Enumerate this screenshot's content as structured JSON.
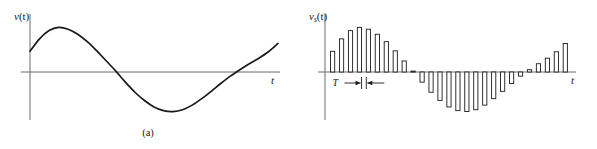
{
  "figure": {
    "width": 597,
    "height": 149,
    "background": "#ffffff",
    "stroke_color": "#1a1a1a",
    "axis_color": "#6b6b6b"
  },
  "panels": [
    {
      "id": "a",
      "caption": "(a)",
      "ylabel": "v(t)",
      "ylabel_base": "v",
      "ylabel_sub": "",
      "ylabel_arg": "(t)",
      "xlabel": "t",
      "kind": "continuous-waveform"
    },
    {
      "id": "b",
      "caption": "(b)",
      "ylabel": "vs(t)",
      "ylabel_base": "v",
      "ylabel_sub": "s",
      "ylabel_arg": "(t)",
      "xlabel": "t",
      "kind": "sampled-pulse-train",
      "period_label": "T"
    }
  ],
  "chart_data": [
    {
      "type": "line",
      "title": "",
      "panel": "a",
      "xlabel": "t",
      "ylabel": "v(t)",
      "grid": false,
      "legend": null,
      "xlim": [
        0,
        26
      ],
      "ylim": [
        -1.15,
        1.15
      ],
      "axis_origin_y": 0,
      "note": "Smooth continuous analog signal: rises from a positive start, peaks early, falls through zero to a deep negative trough, then rises back through zero and climbs at the right edge.",
      "x": [
        0,
        1,
        2,
        3,
        4,
        5,
        6,
        7,
        8,
        9,
        10,
        11,
        12,
        13,
        14,
        15,
        16,
        17,
        18,
        19,
        20,
        21,
        22,
        23,
        24,
        25,
        26
      ],
      "y": [
        0.45,
        0.72,
        0.9,
        0.97,
        0.93,
        0.82,
        0.66,
        0.46,
        0.24,
        0.02,
        -0.22,
        -0.44,
        -0.62,
        -0.76,
        -0.84,
        -0.86,
        -0.82,
        -0.72,
        -0.58,
        -0.42,
        -0.25,
        -0.09,
        0.05,
        0.18,
        0.3,
        0.44,
        0.62
      ]
    },
    {
      "type": "bar",
      "title": "",
      "panel": "b",
      "xlabel": "t",
      "ylabel": "vs(t)",
      "grid": false,
      "legend": null,
      "xlim": [
        0,
        26
      ],
      "ylim": [
        -1.15,
        1.15
      ],
      "axis_origin_y": 0,
      "sampling_period_label": "T",
      "note": "Sampled (pulse-amplitude-modulated) version of v(t): narrow rectangular pulses at uniform interval T whose heights follow the continuous waveform.",
      "categories": [
        "0",
        "1",
        "2",
        "3",
        "4",
        "5",
        "6",
        "7",
        "8",
        "9",
        "10",
        "11",
        "12",
        "13",
        "14",
        "15",
        "16",
        "17",
        "18",
        "19",
        "20",
        "21",
        "22",
        "23",
        "24",
        "25",
        "26"
      ],
      "values": [
        0.45,
        0.72,
        0.9,
        0.97,
        0.93,
        0.82,
        0.66,
        0.46,
        0.24,
        0.02,
        -0.22,
        -0.44,
        -0.62,
        -0.76,
        -0.84,
        -0.86,
        -0.82,
        -0.72,
        -0.58,
        -0.42,
        -0.25,
        -0.09,
        0.05,
        0.18,
        0.3,
        0.44,
        0.62
      ]
    }
  ]
}
